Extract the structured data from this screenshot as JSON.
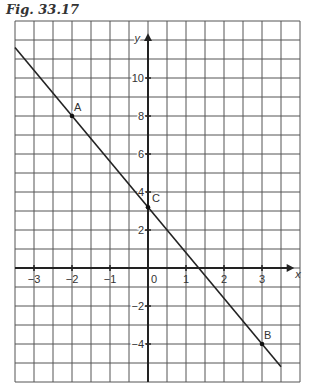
{
  "title": "Fig. 33.17",
  "chart_data": {
    "type": "line",
    "title": "Fig. 33.17",
    "xlabel": "x",
    "ylabel": "y",
    "xlim": [
      -3.5,
      4
    ],
    "ylim": [
      -6,
      13
    ],
    "grid": true,
    "x_ticks": [
      -3,
      -2,
      -1,
      0,
      1,
      2,
      3
    ],
    "x_tick_labels": [
      "−3",
      "−2",
      "−1",
      "0",
      "1",
      "2",
      "3"
    ],
    "y_ticks": [
      -4,
      -2,
      2,
      4,
      6,
      8,
      10
    ],
    "y_tick_labels": [
      "−4",
      "−2",
      "2",
      "4",
      "6",
      "8",
      "10"
    ],
    "series": [
      {
        "name": "line",
        "x": [
          -3.5,
          3.5
        ],
        "y": [
          11.6,
          -5.2
        ]
      }
    ],
    "points": [
      {
        "label": "A",
        "x": -2,
        "y": 8
      },
      {
        "label": "B",
        "x": 3,
        "y": -4
      },
      {
        "label": "C",
        "x": 0,
        "y": 3.2
      }
    ]
  }
}
